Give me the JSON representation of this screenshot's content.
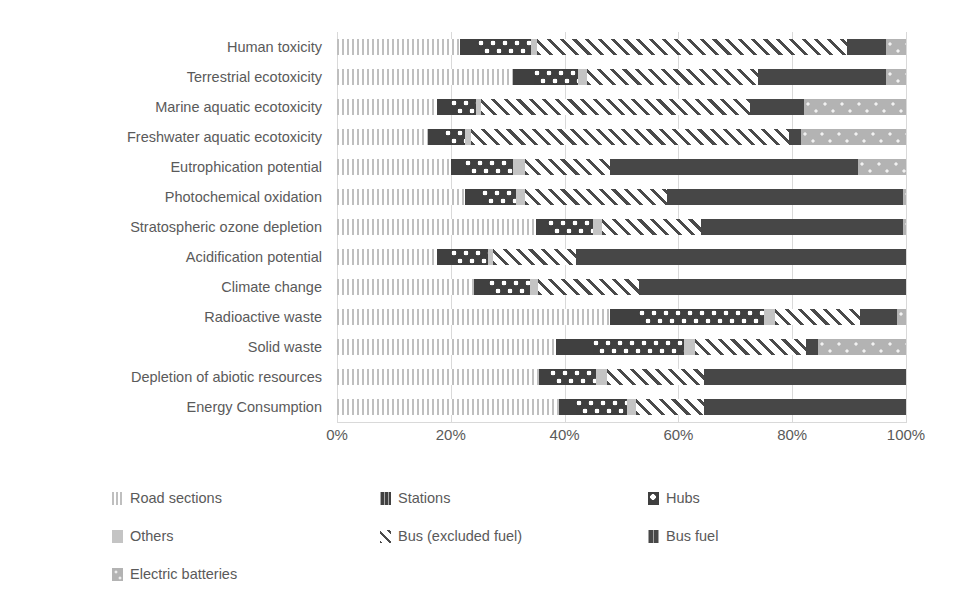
{
  "chart_data": {
    "type": "bar",
    "subtype": "stacked-horizontal-100pct",
    "title": "",
    "xlabel": "",
    "ylabel": "",
    "xlim": [
      0,
      100
    ],
    "xticks": [
      "0%",
      "20%",
      "40%",
      "60%",
      "80%",
      "100%"
    ],
    "xtick_values": [
      0,
      20,
      40,
      60,
      80,
      100
    ],
    "grid": true,
    "legend_position": "bottom",
    "categories": [
      "Human toxicity",
      "Terrestrial ecotoxicity",
      "Marine aquatic ecotoxicity",
      "Freshwater aquatic ecotoxicity",
      "Eutrophication potential",
      "Photochemical oxidation",
      "Stratospheric ozone depletion",
      "Acidification potential",
      "Climate change",
      "Radioactive waste",
      "Solid waste",
      "Depletion of abiotic resources",
      "Energy Consumption"
    ],
    "series": [
      {
        "name": "Road sections",
        "color": "#bfbfbf",
        "pattern": "vertical-lines",
        "values": [
          21.6,
          31.0,
          17.5,
          16.0,
          20.0,
          22.5,
          35.0,
          17.5,
          24.0,
          48.0,
          38.5,
          35.5,
          39.0
        ]
      },
      {
        "name": "Stations",
        "color": "#404040",
        "pattern": "solid-dark",
        "values": [
          3.2,
          3.7,
          2.6,
          3.0,
          2.5,
          3.0,
          2.0,
          2.5,
          2.7,
          5.0,
          6.5,
          2.0,
          3.0
        ]
      },
      {
        "name": "Hubs",
        "color": "#3f3f3f",
        "pattern": "dotted-circles",
        "values": [
          9.3,
          7.7,
          4.4,
          3.5,
          8.5,
          6.0,
          8.0,
          6.5,
          7.3,
          22.0,
          16.0,
          8.0,
          9.0
        ]
      },
      {
        "name": "Others",
        "color": "#c4c4c4",
        "pattern": "solid-light",
        "values": [
          1.0,
          1.6,
          0.8,
          1.0,
          2.0,
          1.5,
          1.5,
          1.0,
          1.3,
          2.0,
          2.0,
          2.0,
          1.5
        ]
      },
      {
        "name": "Bus (excluded fuel)",
        "color": "#4a4a4a",
        "pattern": "diagonal-hatch",
        "values": [
          54.5,
          30.0,
          47.2,
          56.0,
          15.0,
          25.0,
          17.5,
          14.5,
          17.7,
          15.0,
          19.5,
          17.0,
          12.0
        ]
      },
      {
        "name": "Bus fuel",
        "color": "#474747",
        "pattern": "solid-dark",
        "values": [
          6.9,
          22.5,
          9.5,
          2.0,
          43.5,
          41.5,
          35.5,
          58.0,
          47.0,
          6.5,
          2.0,
          35.5,
          35.5
        ]
      },
      {
        "name": "Electric batteries",
        "color": "#b3b3b3",
        "pattern": "light-speckle",
        "values": [
          3.5,
          3.5,
          18.0,
          18.5,
          8.5,
          0.5,
          0.5,
          0.0,
          0.0,
          1.5,
          15.5,
          0.0,
          0.0
        ]
      }
    ]
  },
  "legend": {
    "items": [
      {
        "label": "Road sections",
        "icon": "pattern-vertical-lines-swatch"
      },
      {
        "label": "Stations",
        "icon": "pattern-solid-dark-swatch"
      },
      {
        "label": "Hubs",
        "icon": "pattern-dotted-swatch"
      },
      {
        "label": "Others",
        "icon": "pattern-solid-light-swatch"
      },
      {
        "label": "Bus (excluded fuel)",
        "icon": "pattern-diagonal-hatch-swatch"
      },
      {
        "label": "Bus fuel",
        "icon": "pattern-solid-dark-swatch"
      },
      {
        "label": "Electric batteries",
        "icon": "pattern-light-speckle-swatch"
      }
    ]
  },
  "caption": {
    "text": ""
  }
}
